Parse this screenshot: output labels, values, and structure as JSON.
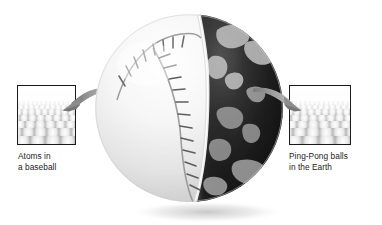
{
  "figure": {
    "name": "scale-comparison-diagram",
    "background_color": "#ffffff",
    "text_color": "#1c1c1c"
  },
  "left_callout": {
    "name": "atoms-in-a-baseball",
    "thumbnail_alt": "packed-spheres-texture",
    "caption": "Atoms in\na baseball",
    "caption_line1": "Atoms in",
    "caption_line2": "a baseball",
    "arrow": "curved-arrow-left",
    "border_color": "#1a1a1a"
  },
  "right_callout": {
    "name": "ping-pong-balls-in-the-earth",
    "thumbnail_alt": "packed-spheres-texture",
    "caption": "Ping-Pong balls\nin the Earth",
    "caption_line1": "Ping-Pong balls",
    "caption_line2": "in the Earth",
    "arrow": "curved-arrow-right",
    "border_color": "#1a1a1a"
  },
  "sphere": {
    "name": "baseball-earth-composite",
    "left_half": "baseball",
    "right_half": "earth-globe",
    "baseball_color": "#f4f4f4",
    "earth_color": "#1d1d1d",
    "seam_color": "#707070",
    "shadow": "soft-drop-shadow"
  },
  "arrow_color": "#8c8c8c"
}
